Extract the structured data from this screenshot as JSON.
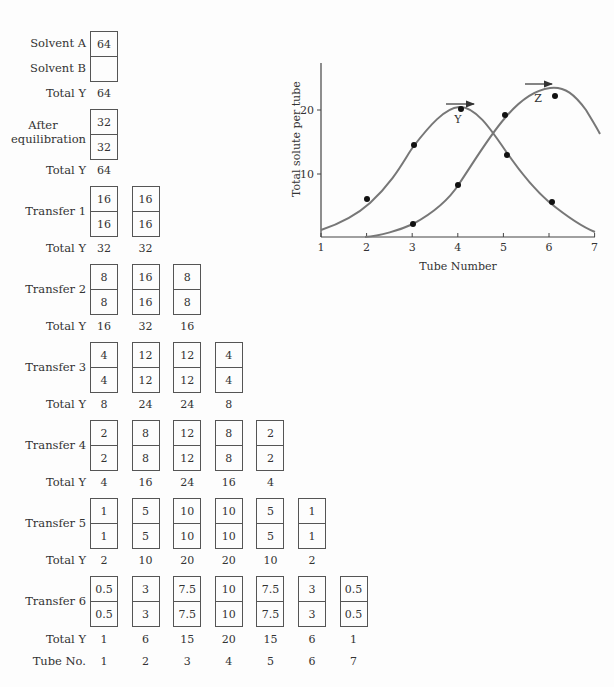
{
  "diagram": {
    "labels": {
      "solvent_a": "Solvent A",
      "solvent_b": "Solvent B",
      "total_y": "Total Y",
      "after_eq_1": "After",
      "after_eq_2": "equilibration",
      "tube_no": "Tube No."
    },
    "stages": [
      {
        "name": "Initial",
        "label": "",
        "tubes": [
          {
            "top": "64",
            "bottom": ""
          }
        ],
        "totals": [
          "64"
        ]
      },
      {
        "name": "After equilibration",
        "label": "",
        "tubes": [
          {
            "top": "32",
            "bottom": "32"
          }
        ],
        "totals": [
          "64"
        ]
      },
      {
        "name": "Transfer 1",
        "label": "Transfer 1",
        "tubes": [
          {
            "top": "16",
            "bottom": "16"
          },
          {
            "top": "16",
            "bottom": "16"
          }
        ],
        "totals": [
          "32",
          "32"
        ]
      },
      {
        "name": "Transfer 2",
        "label": "Transfer 2",
        "tubes": [
          {
            "top": "8",
            "bottom": "8"
          },
          {
            "top": "16",
            "bottom": "16"
          },
          {
            "top": "8",
            "bottom": "8"
          }
        ],
        "totals": [
          "16",
          "32",
          "16"
        ]
      },
      {
        "name": "Transfer 3",
        "label": "Transfer 3",
        "tubes": [
          {
            "top": "4",
            "bottom": "4"
          },
          {
            "top": "12",
            "bottom": "12"
          },
          {
            "top": "12",
            "bottom": "12"
          },
          {
            "top": "4",
            "bottom": "4"
          }
        ],
        "totals": [
          "8",
          "24",
          "24",
          "8"
        ]
      },
      {
        "name": "Transfer 4",
        "label": "Transfer 4",
        "tubes": [
          {
            "top": "2",
            "bottom": "2"
          },
          {
            "top": "8",
            "bottom": "8"
          },
          {
            "top": "12",
            "bottom": "12"
          },
          {
            "top": "8",
            "bottom": "8"
          },
          {
            "top": "2",
            "bottom": "2"
          }
        ],
        "totals": [
          "4",
          "16",
          "24",
          "16",
          "4"
        ]
      },
      {
        "name": "Transfer 5",
        "label": "Transfer 5",
        "tubes": [
          {
            "top": "1",
            "bottom": "1"
          },
          {
            "top": "5",
            "bottom": "5"
          },
          {
            "top": "10",
            "bottom": "10"
          },
          {
            "top": "10",
            "bottom": "10"
          },
          {
            "top": "5",
            "bottom": "5"
          },
          {
            "top": "1",
            "bottom": "1"
          }
        ],
        "totals": [
          "2",
          "10",
          "20",
          "20",
          "10",
          "2"
        ]
      },
      {
        "name": "Transfer 6",
        "label": "Transfer 6",
        "tubes": [
          {
            "top": "0.5",
            "bottom": "0.5"
          },
          {
            "top": "3",
            "bottom": "3"
          },
          {
            "top": "7.5",
            "bottom": "7.5"
          },
          {
            "top": "10",
            "bottom": "10"
          },
          {
            "top": "7.5",
            "bottom": "7.5"
          },
          {
            "top": "3",
            "bottom": "3"
          },
          {
            "top": "0.5",
            "bottom": "0.5"
          }
        ],
        "totals": [
          "1",
          "6",
          "15",
          "20",
          "15",
          "6",
          "1"
        ]
      }
    ],
    "tube_numbers": [
      "1",
      "2",
      "3",
      "4",
      "5",
      "6",
      "7"
    ]
  },
  "chart_data": {
    "type": "line",
    "title": "",
    "xlabel": "Tube Number",
    "ylabel": "Total solute per tube",
    "x_ticks": [
      "1",
      "2",
      "3",
      "4",
      "5",
      "6",
      "7"
    ],
    "y_ticks": [
      "10",
      "20"
    ],
    "xlim": [
      1,
      7
    ],
    "ylim": [
      0,
      27
    ],
    "grid": false,
    "legend": "none (curves labeled inline: Y and Z, each with a rightward arrow above its peak)",
    "series": [
      {
        "name": "Y",
        "points": [
          [
            2,
            6
          ],
          [
            3,
            14.5
          ],
          [
            4.1,
            20.2
          ],
          [
            5.1,
            13
          ],
          [
            6.1,
            5.5
          ]
        ],
        "peak": [
          4,
          20.3
        ]
      },
      {
        "name": "Z",
        "points": [
          [
            3,
            2
          ],
          [
            4,
            8.3
          ],
          [
            5.05,
            19.3
          ],
          [
            6.2,
            22
          ]
        ],
        "peak": [
          5.8,
          23.5
        ]
      }
    ],
    "annotations": [
      "Y",
      "Z",
      "arrow-right above Y peak",
      "arrow-right above Z peak"
    ]
  }
}
